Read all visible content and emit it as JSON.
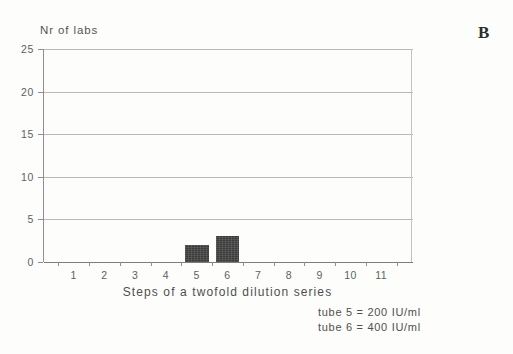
{
  "panel": {
    "label": "B"
  },
  "chart_data": {
    "type": "bar",
    "title": "",
    "xlabel": "Steps of a twofold dilution series",
    "ylabel": "Nr of labs",
    "categories": [
      "1",
      "2",
      "3",
      "4",
      "5",
      "6",
      "7",
      "8",
      "9",
      "10",
      "11"
    ],
    "values": [
      0,
      0,
      0,
      0,
      2,
      3,
      0,
      0,
      0,
      0,
      0
    ],
    "ylim": [
      0,
      25
    ],
    "yticks": [
      0,
      5,
      10,
      15,
      20,
      25
    ],
    "ytick_labels": [
      "0",
      "5",
      "10",
      "15",
      "20",
      "25"
    ],
    "grid": "horizontal",
    "legend": "none",
    "bar_color": "#3b3b3b",
    "gridline_color": "#b9b9b9",
    "axis_color": "#8f8f8f",
    "annotations": [
      "tube 5 = 200 IU/ml",
      "tube 6 = 400 IU/ml"
    ]
  }
}
